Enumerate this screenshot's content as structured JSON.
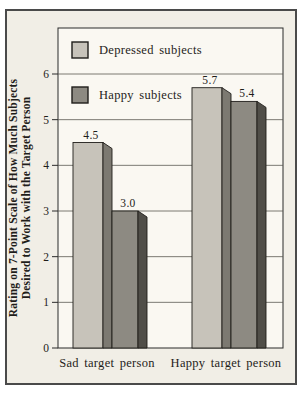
{
  "figure": {
    "bg_color": "#f1eee6",
    "plot_bg_color": "#faf8f2",
    "frame_color": "#4a4a4a",
    "axis_color": "#2b2b2b",
    "grid_color": "#5a5852",
    "outline_color": "#1f1d1a",
    "text_color": "#1f1d1a"
  },
  "chart_data": {
    "type": "bar",
    "title": "",
    "categories": [
      "Sad target person",
      "Happy target person"
    ],
    "series": [
      {
        "name": "Depressed subjects",
        "values": [
          4.5,
          5.7
        ],
        "color": "#c7c3ba",
        "side_color": "#7c7971"
      },
      {
        "name": "Happy subjects",
        "values": [
          3.0,
          5.4
        ],
        "color": "#8d8a82",
        "side_color": "#504e48"
      }
    ],
    "value_labels": [
      [
        "4.5",
        "5.7"
      ],
      [
        "3.0",
        "5.4"
      ]
    ],
    "ylabel_lines": [
      "Rating on 7-Point Scale of How Much Subjects",
      "Desired to Work with the Target Person"
    ],
    "xlabel": "",
    "yticks": [
      0,
      1,
      2,
      3,
      4,
      5,
      6
    ],
    "ylim": [
      0,
      7
    ],
    "grid": true,
    "legend_position": "inside-top-left",
    "style": "pseudo-3d"
  }
}
